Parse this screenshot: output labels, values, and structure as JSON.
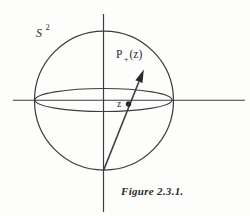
{
  "figure": {
    "colors": {
      "line": "#3d3d3d",
      "ink": "#2a2a2a",
      "paper": "#fdfdfc"
    },
    "labels": {
      "sphere_base": "S",
      "sphere_exponent": "2",
      "projection_base": "P",
      "projection_subscript": "+",
      "projection_argument": "(z)",
      "point": "z"
    },
    "caption": "Figure 2.3.1."
  }
}
